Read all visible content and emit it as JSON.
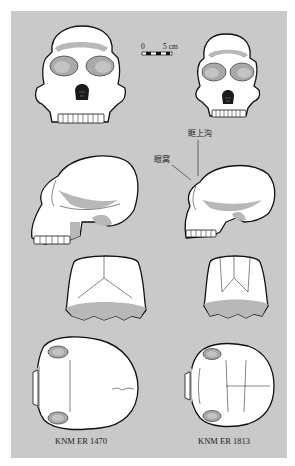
{
  "figure": {
    "background_color": "#c9c9c9",
    "bone_color": "#ffffff",
    "shadow_color": "#b5b5b5",
    "outline_color": "#111111"
  },
  "scale_bar": {
    "start_label": "0",
    "end_label": "5 cm"
  },
  "annotations": {
    "supraorbital_sulcus": "眶上沟",
    "orbit": "眼窝"
  },
  "specimens": [
    {
      "id": "knm-er-1470",
      "caption": "KNM ER 1470",
      "views": [
        "frontal",
        "lateral",
        "occipital",
        "superior"
      ]
    },
    {
      "id": "knm-er-1813",
      "caption": "KNM ER 1813",
      "views": [
        "frontal",
        "lateral",
        "occipital",
        "superior"
      ]
    }
  ]
}
